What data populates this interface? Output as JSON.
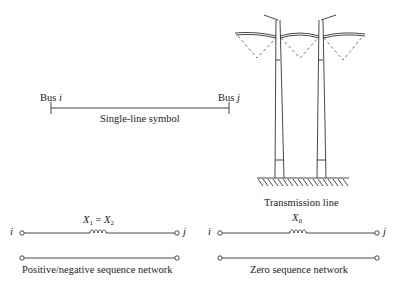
{
  "single_line": {
    "bus_i_label": "Bus",
    "bus_i_var": "i",
    "bus_j_label": "Bus",
    "bus_j_var": "j",
    "caption": "Single-line symbol"
  },
  "transmission_line": {
    "caption": "Transmission line"
  },
  "positive_negative": {
    "node_i": "i",
    "node_j": "j",
    "reactance_x1": "X",
    "reactance_x1_sub": "1",
    "equals": " = ",
    "reactance_x2": "X",
    "reactance_x2_sub": "2",
    "caption": "Positive/negative sequence network"
  },
  "zero_sequence": {
    "node_i": "i",
    "node_j": "j",
    "reactance": "X",
    "reactance_sub": "0",
    "caption": "Zero sequence network"
  },
  "colors": {
    "line": "#333333",
    "dashed": "#555555",
    "background": "#ffffff"
  }
}
